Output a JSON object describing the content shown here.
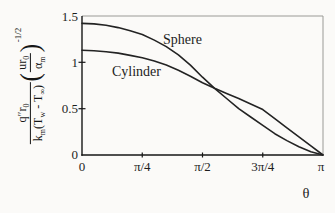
{
  "figure": {
    "curve_label_sphere": "Sphere",
    "curve_label_cylinder": "Cylinder",
    "xaxis_letter": "θ"
  },
  "ylabel": {
    "num_q": "q″r",
    "num_q_sub": "0",
    "den_k": "k",
    "den_k_sub": "m",
    "den_t1": "(T",
    "den_t1_sub": "w",
    "den_t2": " - T",
    "den_t2_sub": "∞",
    "den_close": ")",
    "p_open": "(",
    "p_close": ")",
    "f_num": "ur",
    "f_num_sub": "0",
    "f_den": "α",
    "f_den_sub": "m",
    "exp": "-1/2"
  },
  "chart_data": {
    "type": "line",
    "xlabel": "θ",
    "ylabel": "q″r0 / [km(Tw - T∞)] · (ur0/αm)^(-1/2)",
    "xticks": [
      "0",
      "π/4",
      "π/2",
      "3π/4",
      "π"
    ],
    "yticks": [
      "1.5",
      "1",
      "0.5",
      "0"
    ],
    "xlim_in_pi_units": [
      0,
      1
    ],
    "ylim": [
      0,
      1.5
    ],
    "grid": false,
    "legend_position": "labels-on-curves",
    "x_over_pi": [
      0,
      0.05,
      0.1,
      0.15,
      0.2,
      0.25,
      0.3,
      0.35,
      0.4,
      0.45,
      0.5,
      0.55,
      0.6,
      0.65,
      0.7,
      0.75,
      0.8,
      0.85,
      0.9,
      0.95,
      1
    ],
    "series": [
      {
        "name": "Sphere",
        "values": [
          1.42,
          1.415,
          1.4,
          1.375,
          1.34,
          1.3,
          1.24,
          1.17,
          1.08,
          0.97,
          0.84,
          0.72,
          0.61,
          0.5,
          0.41,
          0.32,
          0.23,
          0.155,
          0.09,
          0.035,
          0
        ]
      },
      {
        "name": "Cylinder",
        "values": [
          1.13,
          1.125,
          1.115,
          1.1,
          1.075,
          1.05,
          1.015,
          0.97,
          0.915,
          0.85,
          0.78,
          0.72,
          0.665,
          0.61,
          0.55,
          0.49,
          0.392,
          0.294,
          0.196,
          0.098,
          0
        ]
      }
    ],
    "colors": {
      "curve": "#232323",
      "frame": "#9a9a96",
      "axis": "#161616"
    }
  }
}
